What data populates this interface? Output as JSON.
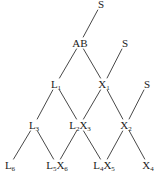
{
  "diagram": {
    "type": "tree",
    "line_color": "#333333",
    "nodes": [
      {
        "id": "s_top",
        "label": "S",
        "x": 101,
        "y": 4
      },
      {
        "id": "ab",
        "label": "AB",
        "x": 80,
        "y": 43
      },
      {
        "id": "s_mid",
        "label": "S",
        "x": 125,
        "y": 43
      },
      {
        "id": "l1",
        "label": "L",
        "sub": "1",
        "x": 56,
        "y": 84
      },
      {
        "id": "x1",
        "label": "X",
        "sub": "1",
        "x": 104,
        "y": 84
      },
      {
        "id": "s_right",
        "label": "S",
        "x": 147,
        "y": 84
      },
      {
        "id": "l3",
        "label": "L",
        "sub": "3",
        "x": 34,
        "y": 125
      },
      {
        "id": "l2x3",
        "label": "L",
        "sub": "2",
        "label2": "X",
        "sub2": "3",
        "x": 80,
        "y": 125
      },
      {
        "id": "x2",
        "label": "X",
        "sub": "2",
        "x": 126,
        "y": 125
      },
      {
        "id": "l6",
        "label": "L",
        "sub": "6",
        "x": 10,
        "y": 165
      },
      {
        "id": "l5x6",
        "label": "L",
        "sub": "5",
        "label2": "X",
        "sub2": "6",
        "x": 57,
        "y": 165
      },
      {
        "id": "l4x5",
        "label": "L",
        "sub": "4",
        "label2": "X",
        "sub2": "5",
        "x": 104,
        "y": 165
      },
      {
        "id": "x4",
        "label": "X",
        "sub": "4",
        "x": 148,
        "y": 165
      }
    ],
    "edges": [
      [
        "s_top",
        "ab"
      ],
      [
        "ab",
        "l1"
      ],
      [
        "ab",
        "x1"
      ],
      [
        "s_mid",
        "x1"
      ],
      [
        "l1",
        "l3"
      ],
      [
        "l1",
        "l2x3"
      ],
      [
        "x1",
        "l2x3"
      ],
      [
        "x1",
        "x2"
      ],
      [
        "s_right",
        "x2"
      ],
      [
        "l3",
        "l6"
      ],
      [
        "l3",
        "l5x6"
      ],
      [
        "l2x3",
        "l5x6"
      ],
      [
        "l2x3",
        "l4x5"
      ],
      [
        "x2",
        "l4x5"
      ],
      [
        "x2",
        "x4"
      ]
    ]
  }
}
